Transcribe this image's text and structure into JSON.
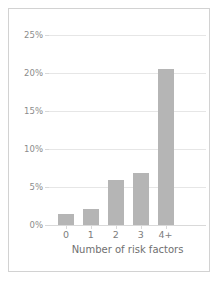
{
  "chart_data": {
    "type": "bar",
    "title": "",
    "xlabel": "Number of risk factors",
    "ylabel": "",
    "categories": [
      "0",
      "1",
      "2",
      "3",
      "4+"
    ],
    "values": [
      1.4,
      2.1,
      5.9,
      6.8,
      20.5
    ],
    "ylim": [
      0,
      25
    ],
    "ytick_values": [
      0,
      5,
      10,
      15,
      20,
      25
    ],
    "ytick_labels": [
      "0%",
      "5%",
      "10%",
      "15%",
      "20%",
      "25%"
    ],
    "grid": true,
    "legend": null,
    "bar_color": "#b5b5b5",
    "gridline_color": "#e6e6e6",
    "axis_color": "#d9d9d9",
    "tick_label_color": "#8c8c8c",
    "border_color": "#d2d2d2",
    "background_color": "#ffffff"
  }
}
